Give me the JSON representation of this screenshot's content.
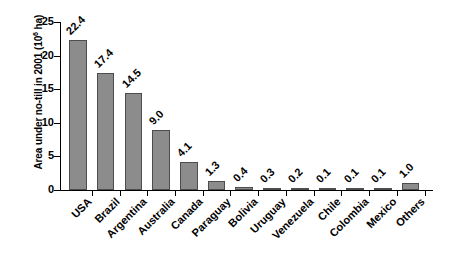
{
  "chart_data": {
    "type": "bar",
    "title": "",
    "xlabel": "",
    "ylabel": "Area under no-till in 2001 (10⁶ ha)",
    "ylabel_main": "Area under no-till in 2001 (10",
    "ylabel_sup": "6",
    "ylabel_tail": " ha)",
    "categories": [
      "USA",
      "Brazil",
      "Argentina",
      "Australia",
      "Canada",
      "Paraguay",
      "Bolivia",
      "Uruguay",
      "Venezuela",
      "Chile",
      "Colombia",
      "Mexico",
      "Others"
    ],
    "values": [
      22.4,
      17.4,
      14.5,
      9.0,
      4.1,
      1.3,
      0.4,
      0.3,
      0.2,
      0.1,
      0.1,
      0.1,
      1.0
    ],
    "value_labels": [
      "22.4",
      "17.4",
      "14.5",
      "9.0",
      "4.1",
      "1.3",
      "0.4",
      "0.3",
      "0.2",
      "0.1",
      "0.1",
      "0.1",
      "1.0"
    ],
    "ylim": [
      0,
      25
    ],
    "yticks": [
      0,
      5,
      10,
      15,
      20,
      25
    ],
    "ytick_labels": [
      "0",
      "5",
      "10",
      "15",
      "20",
      "25"
    ],
    "grid": false,
    "legend": null,
    "bar_color": "#8c8c8c",
    "bar_edge_color": "#4d4d4d",
    "background_color": "#ffffff",
    "axis_color": "#000000"
  }
}
